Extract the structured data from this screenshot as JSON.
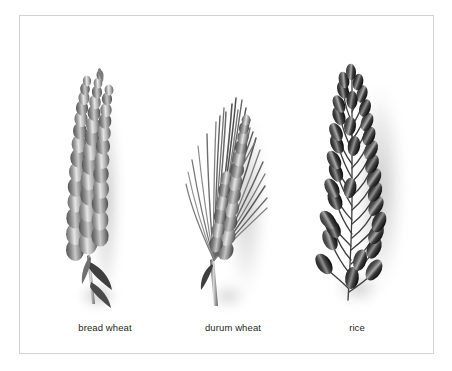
{
  "plate": {
    "background_color": "#ffffff",
    "frame_color": "#d2d2d2",
    "caption_color": "#231f20",
    "title": ""
  },
  "specimens": [
    {
      "id": "bread-wheat",
      "label": "bread wheat",
      "icon": "wheat-ear-icon",
      "description": "upright awnless wheat ear with dense rows of rounded grains and a short stem with two leaf blades",
      "grain_rows": 15,
      "has_awns": false,
      "tone": "light-gray"
    },
    {
      "id": "durum-wheat",
      "label": "durum wheat",
      "icon": "wheat-ear-awned-icon",
      "description": "wheat ear with long bristled awns splaying upward over a central column of grains",
      "grain_rows": 12,
      "has_awns": true,
      "awn_count": 26,
      "tone": "mid-gray"
    },
    {
      "id": "rice",
      "label": "rice",
      "icon": "rice-panicle-icon",
      "description": "open rice panicle with dark teardrop grains on thin curving branchlets",
      "grain_count": 34,
      "has_awns": false,
      "tone": "dark-gray"
    }
  ]
}
